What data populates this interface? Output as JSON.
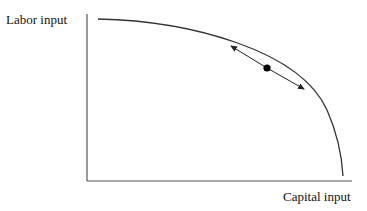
{
  "diagram": {
    "type": "production-possibility-frontier",
    "y_axis_label": "Labor input",
    "x_axis_label": "Capital input",
    "curve": {
      "shape": "concave-to-origin",
      "start": [
        98,
        19
      ],
      "end": [
        343,
        176
      ]
    },
    "point": {
      "position": [
        267,
        68
      ],
      "marker": "filled-circle"
    },
    "tangent": {
      "description": "double-headed arrow tangent to curve at point"
    },
    "colors": {
      "line": "#333333",
      "point": "#000000",
      "background": "#ffffff"
    }
  }
}
